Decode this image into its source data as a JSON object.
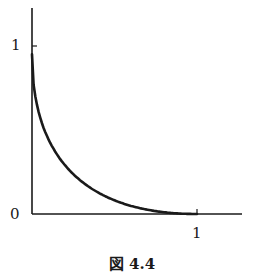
{
  "chart_data": {
    "type": "line",
    "title": "",
    "caption": "図 4.4",
    "xlabel": "",
    "ylabel": "",
    "xlim": [
      0,
      1.25
    ],
    "ylim": [
      0,
      1.2
    ],
    "grid": false,
    "legend": null,
    "x_ticks": [
      {
        "value": 1,
        "label": "1"
      }
    ],
    "y_ticks": [
      {
        "value": 1,
        "label": "1"
      }
    ],
    "origin_label": "0",
    "series": [
      {
        "name": "curve",
        "x": [
          0,
          0.05,
          0.1,
          0.2,
          0.3,
          0.4,
          0.5,
          0.6,
          0.7,
          0.8,
          0.9,
          1.0
        ],
        "y": [
          0.95,
          0.62,
          0.47,
          0.31,
          0.21,
          0.14,
          0.09,
          0.055,
          0.03,
          0.012,
          0.003,
          0
        ]
      }
    ]
  },
  "labels": {
    "y_one": "1",
    "origin": "0",
    "x_one": "1",
    "caption": "図 4.4"
  }
}
